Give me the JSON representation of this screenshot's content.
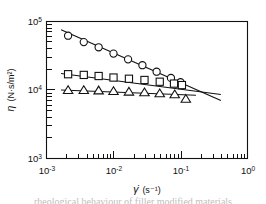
{
  "figure": {
    "caption_partial": "rheological behaviour of filler modified materials",
    "background": "#ffffff",
    "ink_color": "#111111"
  },
  "axes": {
    "x_label_symbol": "γ̇",
    "x_label_units": "(s⁻¹)",
    "y_label_symbol": "η",
    "y_label_units": "(N·s/m²)",
    "x_ticks": [
      {
        "value": 0.001,
        "label_mantissa": "10",
        "label_exponent": "-3"
      },
      {
        "value": 0.01,
        "label_mantissa": "10",
        "label_exponent": "-2"
      },
      {
        "value": 0.1,
        "label_mantissa": "10",
        "label_exponent": "-1"
      },
      {
        "value": 1.0,
        "label_mantissa": "10",
        "label_exponent": "0"
      }
    ],
    "y_ticks": [
      {
        "value": 100000,
        "label_mantissa": "10",
        "label_exponent": "5"
      },
      {
        "value": 10000,
        "label_mantissa": "10",
        "label_exponent": "4"
      },
      {
        "value": 1000,
        "label_mantissa": "10",
        "label_exponent": "3"
      }
    ]
  },
  "chart_data": {
    "type": "scatter",
    "title": "",
    "xlabel": "γ̇ (s⁻¹)",
    "ylabel": "η (N·s/m²)",
    "xscale": "log",
    "yscale": "log",
    "xlim": [
      0.001,
      1.0
    ],
    "ylim": [
      1000,
      100000
    ],
    "grid": false,
    "legend": "none",
    "series": [
      {
        "name": "circles",
        "marker": "circle",
        "x": [
          0.0021,
          0.0036,
          0.006,
          0.01,
          0.0165,
          0.027,
          0.044,
          0.072,
          0.1
        ],
        "y": [
          62000,
          50000,
          42000,
          34000,
          28000,
          23000,
          18500,
          15000,
          13000
        ],
        "fit_line": {
          "x": [
            0.00165,
            0.4
          ],
          "y": [
            76000,
            7000
          ]
        }
      },
      {
        "name": "squares",
        "marker": "square",
        "x": [
          0.0021,
          0.0036,
          0.006,
          0.01,
          0.017,
          0.029,
          0.049,
          0.08,
          0.105
        ],
        "y": [
          17000,
          16600,
          16000,
          15200,
          14600,
          14000,
          13200,
          12400,
          11800
        ],
        "fit_line": {
          "x": [
            0.00165,
            0.4
          ],
          "y": [
            17400,
            8600
          ]
        }
      },
      {
        "name": "triangles",
        "marker": "triangle",
        "x": [
          0.0021,
          0.0036,
          0.006,
          0.01,
          0.017,
          0.029,
          0.049,
          0.082,
          0.12
        ],
        "y": [
          9900,
          9900,
          9800,
          9600,
          9400,
          9200,
          8900,
          8600,
          7400
        ],
        "fit_line": {
          "x": [
            0.00165,
            0.17
          ],
          "y": [
            10000,
            8400
          ]
        }
      }
    ]
  }
}
